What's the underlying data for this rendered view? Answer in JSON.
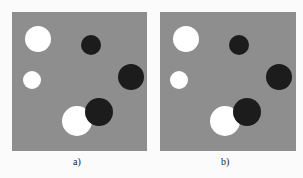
{
  "figure": {
    "panels": [
      {
        "label": "a)",
        "circles": [
          {
            "cx": 26,
            "cy": 27,
            "r": 13,
            "color": "#ffffff"
          },
          {
            "cx": 79,
            "cy": 33,
            "r": 10,
            "color": "#1c1c1c"
          },
          {
            "cx": 20,
            "cy": 68,
            "r": 9,
            "color": "#ffffff"
          },
          {
            "cx": 119,
            "cy": 65,
            "r": 13,
            "color": "#1c1c1c"
          },
          {
            "cx": 65,
            "cy": 109,
            "r": 15,
            "color": "#ffffff"
          },
          {
            "cx": 87,
            "cy": 100,
            "r": 14,
            "color": "#1c1c1c"
          }
        ]
      },
      {
        "label": "b)",
        "circles": [
          {
            "cx": 26,
            "cy": 27,
            "r": 13,
            "color": "#ffffff"
          },
          {
            "cx": 79,
            "cy": 33,
            "r": 10,
            "color": "#1c1c1c"
          },
          {
            "cx": 19,
            "cy": 68,
            "r": 9,
            "color": "#ffffff"
          },
          {
            "cx": 119,
            "cy": 65,
            "r": 13,
            "color": "#1c1c1c"
          },
          {
            "cx": 65,
            "cy": 109,
            "r": 15,
            "color": "#ffffff"
          },
          {
            "cx": 87,
            "cy": 100,
            "r": 14,
            "color": "#1c1c1c"
          }
        ]
      }
    ]
  }
}
